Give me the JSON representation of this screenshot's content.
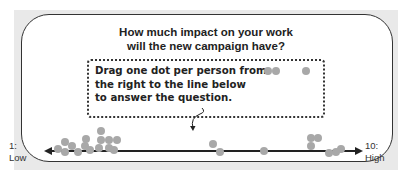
{
  "question": "How much impact on your work\nwill the new campaign have?",
  "instruction": "Drag one dot per person from\nthe right to the line below\nto answer the question.",
  "scale": {
    "low_label": "1:\nLow",
    "high_label": "10:\nHigh"
  },
  "colors": {
    "dot": "#a8a8a8",
    "axis": "#222222",
    "border": "#333333",
    "frame": "#e9e9e9"
  },
  "unplaced_dots": [
    {
      "x": 268,
      "y": 71
    },
    {
      "x": 276,
      "y": 71
    },
    {
      "x": 306,
      "y": 71
    }
  ],
  "placed_dots": [
    {
      "x": 58,
      "y": 149
    },
    {
      "x": 65,
      "y": 142
    },
    {
      "x": 65,
      "y": 152
    },
    {
      "x": 72,
      "y": 146
    },
    {
      "x": 78,
      "y": 152
    },
    {
      "x": 85,
      "y": 146
    },
    {
      "x": 86,
      "y": 139
    },
    {
      "x": 90,
      "y": 150
    },
    {
      "x": 99,
      "y": 148
    },
    {
      "x": 101,
      "y": 131
    },
    {
      "x": 101,
      "y": 140
    },
    {
      "x": 109,
      "y": 140
    },
    {
      "x": 109,
      "y": 148
    },
    {
      "x": 114,
      "y": 150
    },
    {
      "x": 117,
      "y": 140
    },
    {
      "x": 213,
      "y": 144
    },
    {
      "x": 220,
      "y": 152
    },
    {
      "x": 264,
      "y": 151
    },
    {
      "x": 311,
      "y": 138
    },
    {
      "x": 318,
      "y": 138
    },
    {
      "x": 311,
      "y": 146
    },
    {
      "x": 329,
      "y": 153
    },
    {
      "x": 336,
      "y": 152
    },
    {
      "x": 341,
      "y": 149
    }
  ]
}
